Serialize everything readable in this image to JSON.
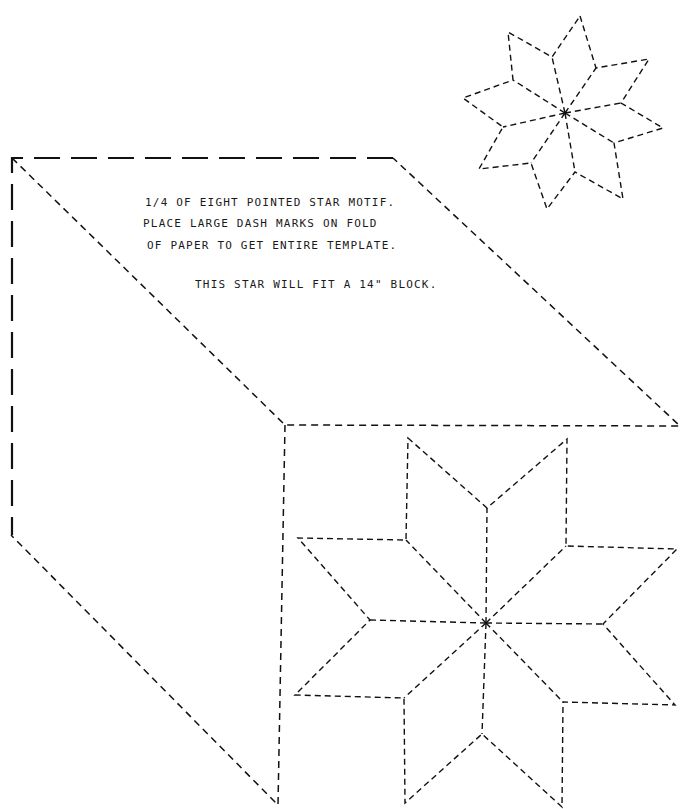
{
  "instructions": {
    "line1": "1/4  OF EIGHT POINTED STAR MOTIF.",
    "line2": "PLACE LARGE DASH MARKS ON FOLD",
    "line3": "OF PAPER TO GET ENTIRE TEMPLATE.",
    "line4": "THIS STAR WILL FIT A 14\" BLOCK."
  },
  "figures": {
    "template_quarter": "quarter-block template outline with fold marks",
    "large_star": "eight pointed star, dashed outline",
    "small_star": "eight pointed star, rotated, dashed outline"
  },
  "colors": {
    "ink": "#111111",
    "paper": "#ffffff"
  }
}
